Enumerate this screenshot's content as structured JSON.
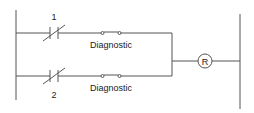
{
  "diagram": {
    "type": "ladder-logic",
    "rungs": [
      {
        "contact_label": "1",
        "contact_type": "normally-closed",
        "switch_label": "Diagnostic",
        "switch_type": "normally-open"
      },
      {
        "contact_label": "2",
        "contact_type": "normally-closed",
        "switch_label": "Diagnostic",
        "switch_type": "normally-open"
      }
    ],
    "output": {
      "label": "R",
      "type": "coil"
    },
    "colors": {
      "line": "#555555",
      "text": "#222222",
      "background": "#ffffff"
    }
  }
}
